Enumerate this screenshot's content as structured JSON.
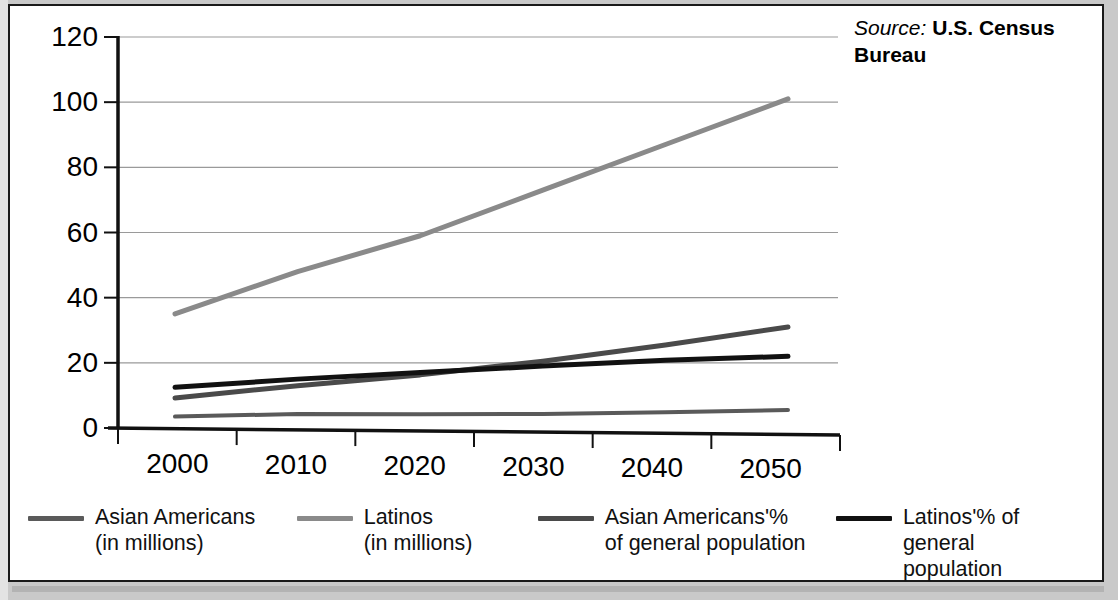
{
  "source": {
    "label": "Source:",
    "value": "U.S. Census Bureau"
  },
  "colors": {
    "asian_millions": "#5a5a5a",
    "latinos_millions": "#8a8a8a",
    "asian_pct": "#4a4a4a",
    "latinos_pct": "#111111",
    "axis": "#111111",
    "grid": "#9a9a9a",
    "card_bg": "#ffffff",
    "page_bg": "#c9c9c9"
  },
  "legend": {
    "items": [
      {
        "label": "Asian Americans\n(in millions)",
        "color_key": "asian_millions",
        "swatch": "#5a5a5a"
      },
      {
        "label": "Latinos\n(in millions)",
        "color_key": "latinos_millions",
        "swatch": "#8a8a8a"
      },
      {
        "label": "Asian Americans'%\nof general population",
        "color_key": "asian_pct",
        "swatch": "#4a4a4a"
      },
      {
        "label": "Latinos'% of\ngeneral population",
        "color_key": "latinos_pct",
        "swatch": "#111111"
      }
    ]
  },
  "chart_data": {
    "type": "line",
    "title": "",
    "subtitle": "",
    "xlabel": "",
    "ylabel": "",
    "x": [
      2000,
      2010,
      2020,
      2030,
      2040,
      2050
    ],
    "categories": [
      "2000",
      "2010",
      "2020",
      "2030",
      "2040",
      "2050"
    ],
    "xlim": [
      2000,
      2050
    ],
    "ylim": [
      0,
      120
    ],
    "yticks": [
      0,
      20,
      40,
      60,
      80,
      100,
      120
    ],
    "ytick_labels": [
      "0",
      "20",
      "40",
      "60",
      "80",
      "100",
      "120"
    ],
    "xticks": [
      2000,
      2010,
      2020,
      2030,
      2040,
      2050
    ],
    "xtick_labels": [
      "2000",
      "2010",
      "2020",
      "2030",
      "2040",
      "2050"
    ],
    "grid": true,
    "grid_axis": "y",
    "legend_position": "bottom",
    "series": [
      {
        "name": "Asian Americans (in millions)",
        "color": "#5a5a5a",
        "width": 4,
        "values": [
          3.5,
          4.3,
          4.2,
          4.3,
          4.8,
          5.5
        ]
      },
      {
        "name": "Latinos (in millions)",
        "color": "#8a8a8a",
        "width": 5,
        "values": [
          35,
          48,
          59,
          73,
          87,
          101
        ]
      },
      {
        "name": "Asian Americans'% of general population",
        "color": "#4a4a4a",
        "width": 5,
        "values": [
          9.2,
          13.0,
          16.3,
          20.5,
          25.5,
          31.0
        ]
      },
      {
        "name": "Latinos'% of general population",
        "color": "#111111",
        "width": 5,
        "values": [
          12.5,
          15.0,
          17.0,
          19.0,
          20.8,
          22.0
        ]
      }
    ]
  }
}
